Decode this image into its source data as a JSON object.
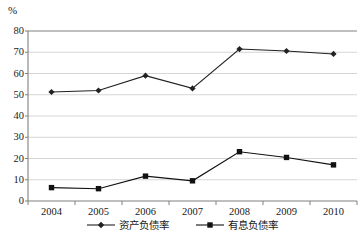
{
  "chart_data": {
    "type": "line",
    "title": "",
    "subtitle": "",
    "xlabel": "",
    "ylabel": "%",
    "unit_label": "%",
    "categories": [
      "2004",
      "2005",
      "2006",
      "2007",
      "2008",
      "2009",
      "2010"
    ],
    "ylim": [
      0,
      80
    ],
    "y_ticks": [
      "0",
      "10",
      "20",
      "30",
      "40",
      "50",
      "60",
      "70",
      "80"
    ],
    "y_tick_values": [
      0,
      10,
      20,
      30,
      40,
      50,
      60,
      70,
      80
    ],
    "grid": true,
    "grid_axis": "y",
    "legend_position": "bottom",
    "series": [
      {
        "name": "资产负债率",
        "marker": "diamond",
        "color": "#222222",
        "values": [
          51.3,
          52.0,
          59.0,
          53.0,
          71.5,
          70.6,
          69.2
        ]
      },
      {
        "name": "有息负债率",
        "marker": "square",
        "color": "#111111",
        "values": [
          6.3,
          5.8,
          11.7,
          9.5,
          23.2,
          20.5,
          17.0
        ]
      }
    ]
  },
  "colors": {
    "axis": "#808080",
    "grid": "#cccccc",
    "series_primary": "#222222",
    "series_secondary": "#111111",
    "text": "#1a1a1a",
    "background": "#ffffff"
  }
}
